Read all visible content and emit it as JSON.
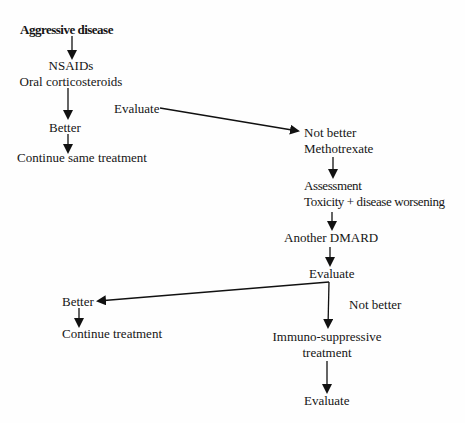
{
  "diagram": {
    "type": "flowchart",
    "colors": {
      "background": "#fefefe",
      "text": "#151515",
      "arrow": "#111111"
    },
    "nodes": {
      "aggressive_disease": "Aggressive disease",
      "nsaids_line1": "NSAIDs",
      "nsaids_line2": "Oral corticosteroids",
      "evaluate_1": "Evaluate",
      "better_1": "Better",
      "continue_same": "Continue same treatment",
      "not_better_1": "Not better",
      "methotrexate": "Methotrexate",
      "assessment_line1": "Assessment",
      "assessment_line2": "Toxicity + disease worsening",
      "another_dmard": "Another DMARD",
      "evaluate_2": "Evaluate",
      "better_2": "Better",
      "continue_treatment": "Continue treatment",
      "not_better_2": "Not better",
      "immuno_line1": "Immuno-suppressive",
      "immuno_line2": "treatment",
      "evaluate_3": "Evaluate"
    },
    "edges": [
      {
        "from": "Aggressive disease",
        "to": "NSAIDs / Oral corticosteroids"
      },
      {
        "from": "NSAIDs / Oral corticosteroids",
        "to": "Better"
      },
      {
        "from": "Better",
        "to": "Continue same treatment"
      },
      {
        "from": "Evaluate",
        "to": "Not better / Methotrexate"
      },
      {
        "from": "Methotrexate",
        "to": "Assessment / Toxicity + disease worsening"
      },
      {
        "from": "Toxicity + disease worsening",
        "to": "Another DMARD"
      },
      {
        "from": "Another DMARD",
        "to": "Evaluate"
      },
      {
        "from": "Evaluate",
        "to": "Better",
        "label": ""
      },
      {
        "from": "Better",
        "to": "Continue treatment"
      },
      {
        "from": "Evaluate",
        "to": "Immuno-suppressive treatment",
        "label": "Not better"
      },
      {
        "from": "Immuno-suppressive treatment",
        "to": "Evaluate"
      }
    ]
  }
}
